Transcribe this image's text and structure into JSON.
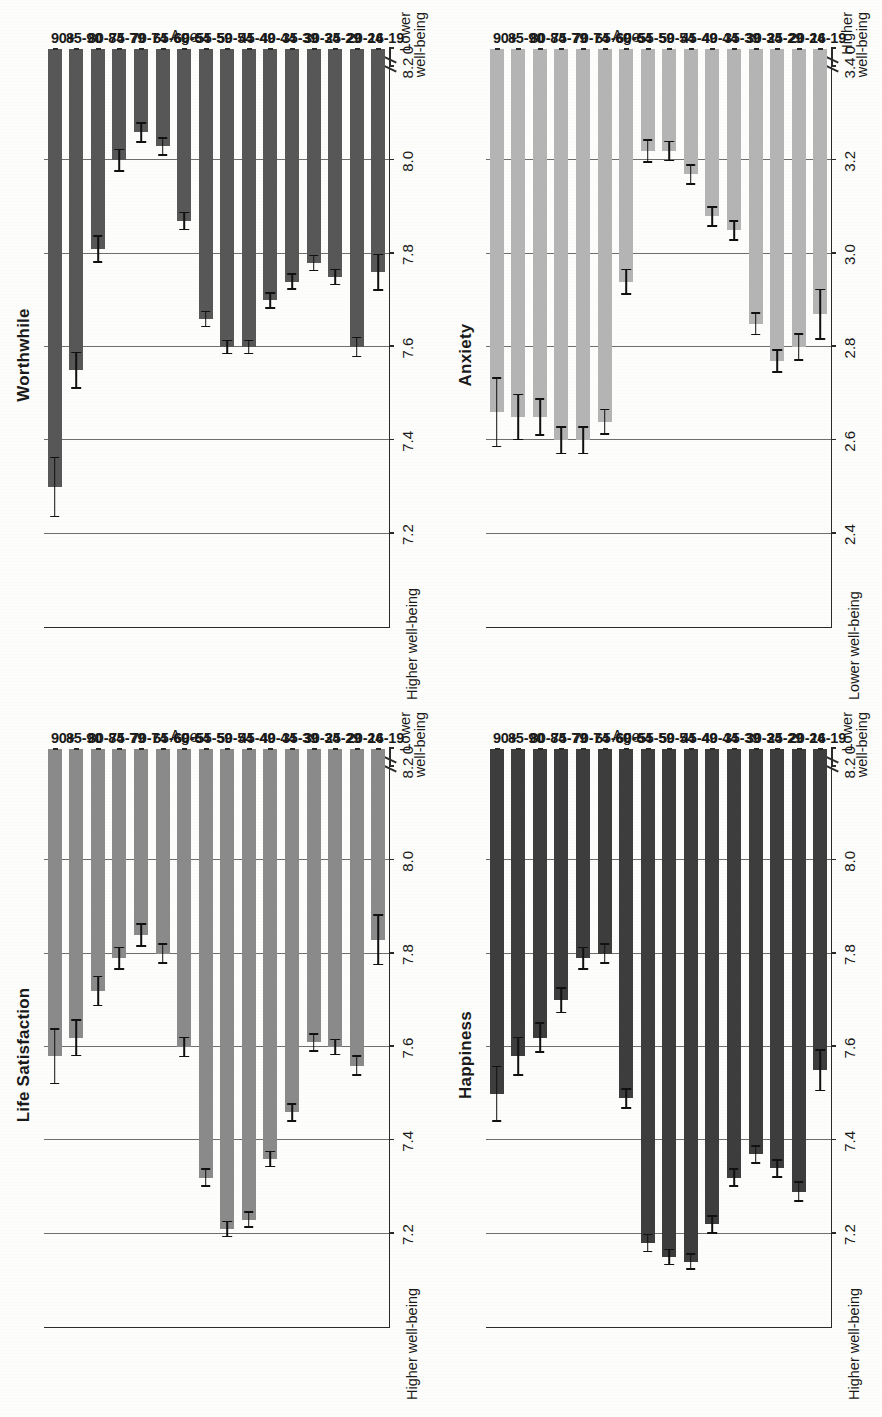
{
  "page": {
    "background_color": "#fdfdfb",
    "rotation_note": "scanned page rotated 90 degrees counter-clockwise"
  },
  "axis_labels": {
    "category_axis_title": "Age",
    "higher_wellbeing": "Higher well-being",
    "lower_wellbeing": "Lower\nwell-being",
    "higher_line1": "Higher",
    "lower_line1": "Lower",
    "wellbeing_line2": "well-being",
    "zero_tick": "0"
  },
  "categories": [
    "16-19",
    "20-24",
    "25-29",
    "30-34",
    "35-39",
    "40-44",
    "45-49",
    "50-54",
    "55-59",
    "60-64",
    "65-69",
    "70-74",
    "75-79",
    "80-84",
    "85-90",
    "90+"
  ],
  "chart_data": [
    {
      "id": "life-satisfaction",
      "type": "bar",
      "title": "Life Satisfaction",
      "xlabel": "Age",
      "ylabel": "",
      "orientation": "vertical-bars-rotated",
      "bar_color": "#8a8a8a",
      "ylim": [
        7.0,
        8.2
      ],
      "ticks": [
        "8.2",
        "8.0",
        "7.8",
        "7.6",
        "7.4",
        "7.2",
        "0"
      ],
      "tick_values": [
        8.2,
        8.0,
        7.8,
        7.6,
        7.4,
        7.2
      ],
      "axis_break": true,
      "high_end_label": "Higher well-being",
      "low_end_label": "Lower well-being",
      "categories": [
        "16-19",
        "20-24",
        "25-29",
        "30-34",
        "35-39",
        "40-44",
        "45-49",
        "50-54",
        "55-59",
        "60-64",
        "65-69",
        "70-74",
        "75-79",
        "80-84",
        "85-90",
        "90+"
      ],
      "values": [
        7.83,
        7.56,
        7.6,
        7.61,
        7.46,
        7.36,
        7.23,
        7.21,
        7.32,
        7.6,
        7.8,
        7.84,
        7.79,
        7.72,
        7.62,
        7.58
      ],
      "errors": [
        0.055,
        0.022,
        0.018,
        0.02,
        0.02,
        0.018,
        0.018,
        0.018,
        0.02,
        0.022,
        0.022,
        0.025,
        0.025,
        0.033,
        0.04,
        0.06
      ]
    },
    {
      "id": "worthwhile",
      "type": "bar",
      "title": "Worthwhile",
      "xlabel": "Age",
      "ylabel": "",
      "orientation": "vertical-bars-rotated",
      "bar_color": "#575757",
      "ylim": [
        7.0,
        8.2
      ],
      "ticks": [
        "8.2",
        "8.0",
        "7.8",
        "7.6",
        "7.4",
        "7.2",
        "0"
      ],
      "tick_values": [
        8.2,
        8.0,
        7.8,
        7.6,
        7.4,
        7.2
      ],
      "axis_break": true,
      "high_end_label": "Higher well-being",
      "low_end_label": "Lower well-being",
      "categories": [
        "16-19",
        "20-24",
        "25-29",
        "30-34",
        "35-39",
        "40-44",
        "45-49",
        "50-54",
        "55-59",
        "60-64",
        "65-69",
        "70-74",
        "75-79",
        "80-84",
        "85-90",
        "90+"
      ],
      "values": [
        7.76,
        7.6,
        7.75,
        7.78,
        7.74,
        7.7,
        7.6,
        7.6,
        7.66,
        7.87,
        8.03,
        8.06,
        8.0,
        7.81,
        7.55,
        7.3
      ],
      "errors": [
        0.04,
        0.022,
        0.018,
        0.018,
        0.018,
        0.018,
        0.016,
        0.016,
        0.018,
        0.02,
        0.02,
        0.022,
        0.025,
        0.03,
        0.04,
        0.065
      ]
    },
    {
      "id": "happiness",
      "type": "bar",
      "title": "Happiness",
      "xlabel": "Age",
      "ylabel": "",
      "orientation": "vertical-bars-rotated",
      "bar_color": "#3d3d3d",
      "ylim": [
        7.0,
        8.2
      ],
      "ticks": [
        "8.2",
        "8.0",
        "7.8",
        "7.6",
        "7.4",
        "7.2",
        "0"
      ],
      "tick_values": [
        8.2,
        8.0,
        7.8,
        7.6,
        7.4,
        7.2
      ],
      "axis_break": true,
      "high_end_label": "Higher well-being",
      "low_end_label": "Lower well-being",
      "categories": [
        "16-19",
        "20-24",
        "25-29",
        "30-34",
        "35-39",
        "40-44",
        "45-49",
        "50-54",
        "55-59",
        "60-64",
        "65-69",
        "70-74",
        "75-79",
        "80-84",
        "85-90",
        "90+"
      ],
      "values": [
        7.55,
        7.29,
        7.34,
        7.37,
        7.32,
        7.22,
        7.14,
        7.15,
        7.18,
        7.49,
        7.8,
        7.79,
        7.7,
        7.62,
        7.58,
        7.5
      ],
      "errors": [
        0.045,
        0.022,
        0.02,
        0.02,
        0.02,
        0.02,
        0.018,
        0.018,
        0.02,
        0.022,
        0.022,
        0.025,
        0.028,
        0.033,
        0.042,
        0.06
      ]
    },
    {
      "id": "anxiety",
      "type": "bar",
      "title": "Anxiety",
      "xlabel": "Age",
      "ylabel": "",
      "orientation": "vertical-bars-rotated",
      "bar_color": "#b4b4b4",
      "ylim": [
        2.2,
        3.4
      ],
      "ticks": [
        "3.4",
        "3.2",
        "3.0",
        "2.8",
        "2.6",
        "2.4",
        "0"
      ],
      "tick_values": [
        3.4,
        3.2,
        3.0,
        2.8,
        2.6,
        2.4
      ],
      "axis_break": true,
      "high_end_label": "Lower well-being",
      "low_end_label": "Higher well-being",
      "categories": [
        "16-19",
        "20-24",
        "25-29",
        "30-34",
        "35-39",
        "40-44",
        "45-49",
        "50-54",
        "55-59",
        "60-64",
        "65-69",
        "70-74",
        "75-79",
        "80-84",
        "85-90",
        "90+"
      ],
      "values": [
        2.87,
        2.8,
        2.77,
        2.85,
        3.05,
        3.08,
        3.17,
        3.22,
        3.22,
        2.94,
        2.64,
        2.6,
        2.6,
        2.65,
        2.65,
        2.66
      ],
      "errors": [
        0.055,
        0.03,
        0.025,
        0.025,
        0.022,
        0.022,
        0.022,
        0.022,
        0.025,
        0.028,
        0.028,
        0.03,
        0.03,
        0.04,
        0.05,
        0.075
      ]
    }
  ]
}
